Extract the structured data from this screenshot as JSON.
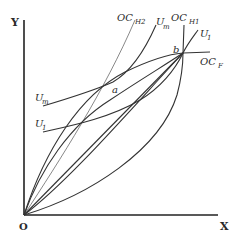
{
  "diagram": {
    "axes": {
      "y_label": "Y",
      "x_label": "X",
      "origin_label": "O"
    },
    "curves": {
      "oc_h2": {
        "main": "OC",
        "sub": "H2"
      },
      "oc_h1": {
        "main": "OC",
        "sub": "H1"
      },
      "oc_f": {
        "main": "OC",
        "sub": "F"
      },
      "u_m_top": {
        "main": "U",
        "sub": "m"
      },
      "u_m_left": {
        "main": "U",
        "sub": "m"
      },
      "u_1_top": {
        "main": "U",
        "sub": "1"
      },
      "u_1_left": {
        "main": "U",
        "sub": "1"
      }
    },
    "points": {
      "a": "a",
      "b": "b"
    },
    "colors": {
      "stroke": "#333333",
      "background": "#ffffff"
    }
  }
}
